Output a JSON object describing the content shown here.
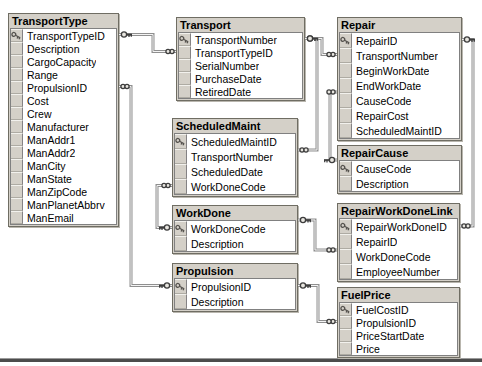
{
  "diagram": {
    "background": "#ffffff",
    "colors": {
      "table_header_fill": "#d4d0c8",
      "table_body_fill": "#ffffff",
      "table_border": "#6f6d63",
      "connector_line": "#8f8f8f",
      "connector_groove": "#f4f4f4",
      "glyph_stroke": "#3d3d3d",
      "primary_key_icon": "#55524e",
      "bottom_rule": "#4c4c4c"
    },
    "icons": {
      "primary_key": "key",
      "relation_one_side": "key",
      "relation_many_side": "infinity"
    },
    "tables": [
      {
        "name": "TransportType",
        "x": 8,
        "y": 13,
        "width": 111,
        "row_height": 13,
        "fields": [
          {
            "name": "TransportTypeID",
            "pk": true
          },
          {
            "name": "Description",
            "pk": false
          },
          {
            "name": "CargoCapacity",
            "pk": false
          },
          {
            "name": "Range",
            "pk": false
          },
          {
            "name": "PropulsionID",
            "pk": false
          },
          {
            "name": "Cost",
            "pk": false
          },
          {
            "name": "Crew",
            "pk": false
          },
          {
            "name": "Manufacturer",
            "pk": false
          },
          {
            "name": "ManAddr1",
            "pk": false
          },
          {
            "name": "ManAddr2",
            "pk": false
          },
          {
            "name": "ManCity",
            "pk": false
          },
          {
            "name": "ManState",
            "pk": false
          },
          {
            "name": "ManZipCode",
            "pk": false
          },
          {
            "name": "ManPlanetAbbrv",
            "pk": false
          },
          {
            "name": "ManEmail",
            "pk": false
          }
        ]
      },
      {
        "name": "Transport",
        "x": 176,
        "y": 17,
        "width": 129,
        "row_height": 13,
        "fields": [
          {
            "name": "TransportNumber",
            "pk": true
          },
          {
            "name": "TransportTypeID",
            "pk": false
          },
          {
            "name": "SerialNumber",
            "pk": false
          },
          {
            "name": "PurchaseDate",
            "pk": false
          },
          {
            "name": "RetiredDate",
            "pk": false
          }
        ]
      },
      {
        "name": "ScheduledMaint",
        "x": 172,
        "y": 118,
        "width": 126,
        "row_height": 15,
        "fields": [
          {
            "name": "ScheduledMaintID",
            "pk": true
          },
          {
            "name": "TransportNumber",
            "pk": false
          },
          {
            "name": "ScheduledDate",
            "pk": false
          },
          {
            "name": "WorkDoneCode",
            "pk": false
          }
        ]
      },
      {
        "name": "WorkDone",
        "x": 172,
        "y": 205,
        "width": 126,
        "row_height": 15,
        "fields": [
          {
            "name": "WorkDoneCode",
            "pk": true
          },
          {
            "name": "Description",
            "pk": false
          }
        ]
      },
      {
        "name": "Propulsion",
        "x": 172,
        "y": 263,
        "width": 126,
        "row_height": 15,
        "fields": [
          {
            "name": "PropulsionID",
            "pk": true
          },
          {
            "name": "Description",
            "pk": false
          }
        ]
      },
      {
        "name": "Repair",
        "x": 337,
        "y": 17,
        "width": 125,
        "row_height": 15,
        "fields": [
          {
            "name": "RepairID",
            "pk": true
          },
          {
            "name": "TransportNumber",
            "pk": false
          },
          {
            "name": "BeginWorkDate",
            "pk": false
          },
          {
            "name": "EndWorkDate",
            "pk": false
          },
          {
            "name": "CauseCode",
            "pk": false
          },
          {
            "name": "RepairCost",
            "pk": false
          },
          {
            "name": "ScheduledMaintID",
            "pk": false
          }
        ]
      },
      {
        "name": "RepairCause",
        "x": 337,
        "y": 145,
        "width": 125,
        "row_height": 15,
        "fields": [
          {
            "name": "CauseCode",
            "pk": true
          },
          {
            "name": "Description",
            "pk": false
          }
        ]
      },
      {
        "name": "RepairWorkDoneLink",
        "x": 337,
        "y": 203,
        "width": 123,
        "row_height": 15,
        "fields": [
          {
            "name": "RepairWorkDoneID",
            "pk": true
          },
          {
            "name": "RepairID",
            "pk": false
          },
          {
            "name": "WorkDoneCode",
            "pk": false
          },
          {
            "name": "EmployeeNumber",
            "pk": false
          }
        ]
      },
      {
        "name": "FuelPrice",
        "x": 337,
        "y": 287,
        "width": 123,
        "row_height": 13,
        "fields": [
          {
            "name": "FuelCostID",
            "pk": true
          },
          {
            "name": "PropulsionID",
            "pk": false
          },
          {
            "name": "PriceStartDate",
            "pk": false
          },
          {
            "name": "Price",
            "pk": false
          }
        ]
      }
    ],
    "relations": [
      {
        "one_table": "TransportType",
        "one_field": "TransportTypeID",
        "many_table": "Transport",
        "many_field": "TransportTypeID",
        "points": [
          [
            119,
            34.5
          ],
          [
            153,
            34.5
          ],
          [
            153,
            51.5
          ],
          [
            176,
            51.5
          ]
        ]
      },
      {
        "one_table": "Propulsion",
        "one_field": "PropulsionID",
        "many_table": "TransportType",
        "many_field": "PropulsionID",
        "points": [
          [
            172,
            285.5
          ],
          [
            131,
            285.5
          ],
          [
            131,
            86.5
          ],
          [
            119,
            86.5
          ]
        ]
      },
      {
        "one_table": "Transport",
        "one_field": "TransportNumber",
        "many_table": "Repair",
        "many_field": "TransportNumber",
        "points": [
          [
            305,
            38.5
          ],
          [
            322,
            38.5
          ],
          [
            322,
            54.5
          ],
          [
            337,
            54.5
          ]
        ]
      },
      {
        "one_table": "Transport",
        "one_field": "TransportNumber",
        "many_table": "ScheduledMaint",
        "many_field": "TransportNumber",
        "points": [
          [
            305,
            38.5
          ],
          [
            317,
            38.5
          ],
          [
            317,
            150
          ],
          [
            298,
            150
          ]
        ]
      },
      {
        "one_table": "WorkDone",
        "one_field": "WorkDoneCode",
        "many_table": "ScheduledMaint",
        "many_field": "WorkDoneCode",
        "points": [
          [
            172,
            227.5
          ],
          [
            157,
            227.5
          ],
          [
            157,
            185.5
          ],
          [
            172,
            185.5
          ]
        ]
      },
      {
        "one_table": "WorkDone",
        "one_field": "WorkDoneCode",
        "many_table": "RepairWorkDoneLink",
        "many_field": "WorkDoneCode",
        "points": [
          [
            298,
            220
          ],
          [
            315,
            220
          ],
          [
            315,
            250
          ],
          [
            337,
            250
          ]
        ]
      },
      {
        "one_table": "RepairCause",
        "one_field": "CauseCode",
        "many_table": "Repair",
        "many_field": "CauseCode",
        "points": [
          [
            337,
            160
          ],
          [
            330,
            160
          ],
          [
            330,
            92
          ],
          [
            337,
            92
          ]
        ]
      },
      {
        "one_table": "Repair",
        "one_field": "RepairID",
        "many_table": "RepairWorkDoneLink",
        "many_field": "RepairID",
        "points": [
          [
            462,
            39.5
          ],
          [
            473,
            39.5
          ],
          [
            473,
            226
          ],
          [
            460,
            226
          ]
        ]
      },
      {
        "one_table": "Propulsion",
        "one_field": "PropulsionID",
        "many_table": "FuelPrice",
        "many_field": "PropulsionID",
        "points": [
          [
            298,
            285.5
          ],
          [
            318,
            285.5
          ],
          [
            318,
            321.5
          ],
          [
            337,
            321.5
          ]
        ]
      }
    ],
    "bottom_rule_y": 358,
    "canvas": {
      "width": 482,
      "height": 366
    }
  }
}
